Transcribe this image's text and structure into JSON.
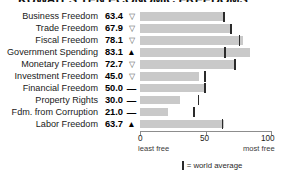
{
  "chart_data": {
    "type": "bar",
    "title": "KUWAIT'S TEN ECONOMIC FREEDOMS",
    "xlabel": "",
    "ylabel": "",
    "xlim": [
      0,
      100
    ],
    "grid": false,
    "orientation": "horizontal",
    "categories": [
      "Business Freedom",
      "Trade Freedom",
      "Fiscal Freedom",
      "Government Spending",
      "Monetary Freedom",
      "Investment Freedom",
      "Financial Freedom",
      "Property Rights",
      "Fdm. from Corruption",
      "Labor Freedom"
    ],
    "values": [
      63.4,
      67.9,
      78.1,
      83.1,
      72.7,
      45.0,
      50.0,
      30.0,
      21.0,
      63.7
    ],
    "value_labels": [
      "63.4",
      "67.9",
      "78.1",
      "83.1",
      "72.7",
      "45.0",
      "50.0",
      "30.0",
      "21.0",
      "63.7"
    ],
    "trend_symbols": [
      "down",
      "down",
      "down",
      "up",
      "down",
      "down",
      "flat",
      "flat",
      "flat",
      "up"
    ],
    "trend_glyphs": [
      "▽",
      "▽",
      "▽",
      "▲",
      "▽",
      "▽",
      "—",
      "—",
      "—",
      "▲"
    ],
    "world_average": [
      63.0,
      68.5,
      74.7,
      63.6,
      71.2,
      48.8,
      48.5,
      43.6,
      40.5,
      61.9
    ],
    "series": [
      {
        "name": "Kuwait score",
        "values": [
          63.4,
          67.9,
          78.1,
          83.1,
          72.7,
          45.0,
          50.0,
          30.0,
          21.0,
          63.7
        ]
      },
      {
        "name": "world average",
        "values": [
          63.0,
          68.5,
          74.7,
          63.6,
          71.2,
          48.8,
          48.5,
          43.6,
          40.5,
          61.9
        ]
      }
    ],
    "xticks": [
      0,
      50,
      100
    ],
    "xticklabels": [
      "0",
      "50",
      "100"
    ],
    "axis_note_left": "least free",
    "axis_note_right": "most free",
    "legend": {
      "position": "bottom-center",
      "entries": [
        {
          "label": "= world average",
          "marker": "vertical-bar",
          "color": "#2b2b2b"
        }
      ]
    },
    "colors": {
      "bar": "#c9c9c9",
      "marker": "#2b2b2b",
      "axis": "#8d8d8d",
      "text": "#1a1a1a"
    }
  },
  "rows": [
    {
      "label": "Business Freedom",
      "value": "63.4",
      "symbol": "▽",
      "symbol_class": "down"
    },
    {
      "label": "Trade Freedom",
      "value": "67.9",
      "symbol": "▽",
      "symbol_class": "down"
    },
    {
      "label": "Fiscal Freedom",
      "value": "78.1",
      "symbol": "▽",
      "symbol_class": "down"
    },
    {
      "label": "Government Spending",
      "value": "83.1",
      "symbol": "▲",
      "symbol_class": "up"
    },
    {
      "label": "Monetary Freedom",
      "value": "72.7",
      "symbol": "▽",
      "symbol_class": "down"
    },
    {
      "label": "Investment Freedom",
      "value": "45.0",
      "symbol": "▽",
      "symbol_class": "down"
    },
    {
      "label": "Financial Freedom",
      "value": "50.0",
      "symbol": "—",
      "symbol_class": "dash"
    },
    {
      "label": "Property Rights",
      "value": "30.0",
      "symbol": "—",
      "symbol_class": "dash"
    },
    {
      "label": "Fdm. from Corruption",
      "value": "21.0",
      "symbol": "—",
      "symbol_class": "dash"
    },
    {
      "label": "Labor Freedom",
      "value": "63.7",
      "symbol": "▲",
      "symbol_class": "up"
    }
  ],
  "axis": {
    "tick0": "0",
    "tick50": "50",
    "tick100": "100",
    "note_left": "least free",
    "note_right": "most free"
  },
  "legend": {
    "text": "= world average"
  },
  "title": "KUWAIT'S TEN ECONOMIC FREEDOMS"
}
